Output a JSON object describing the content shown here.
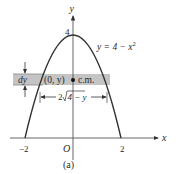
{
  "figure": {
    "caption": "(a)",
    "axes": {
      "x_label": "x",
      "y_label": "y",
      "origin_label": "O",
      "x_ticks": [
        "−2",
        "2"
      ],
      "y_ticks": [
        "4"
      ]
    },
    "curve_label": "y = 4 − x²",
    "curve_equation": {
      "lhs": "y = 4 − x",
      "exp": "2"
    },
    "strip": {
      "point_label": "(0, y)",
      "center_of_mass_label": "c.m.",
      "thickness_label": "dy",
      "width_label": {
        "coef": "2",
        "radicand": "4 − y"
      }
    },
    "colors": {
      "curve": "#333333",
      "strip_fill": "#bfbfbf",
      "axis": "#555555",
      "text": "#2a2a2a"
    }
  }
}
